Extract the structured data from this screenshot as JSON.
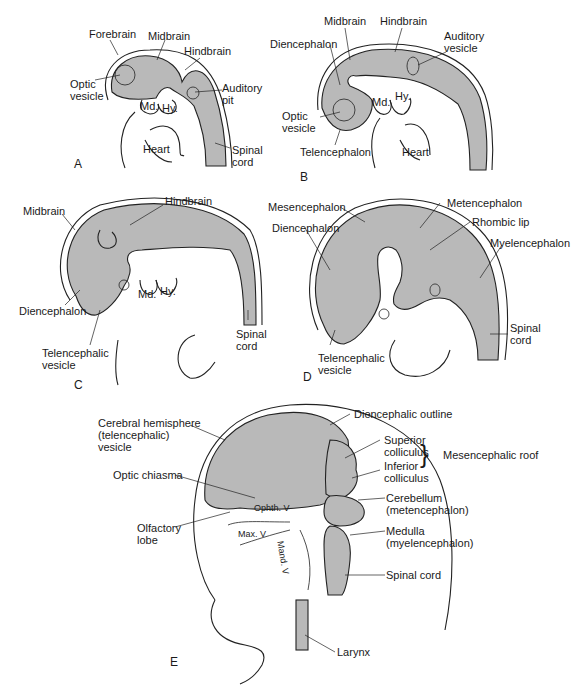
{
  "panels": {
    "A": {
      "letter": "A",
      "labels": {
        "forebrain": "Forebrain",
        "midbrain": "Midbrain",
        "hindbrain": "Hindbrain",
        "optic_vesicle": "Optic\nvesicle",
        "auditory_pit": "Auditory\npit",
        "md": "Md.",
        "hy": "Hy.",
        "heart": "Heart",
        "spinal_cord": "Spinal\ncord"
      }
    },
    "B": {
      "letter": "B",
      "labels": {
        "midbrain": "Midbrain",
        "hindbrain": "Hindbrain",
        "diencephalon": "Diencephalon",
        "auditory_vesicle": "Auditory\nvesicle",
        "optic_vesicle": "Optic\nvesicle",
        "md": "Md.",
        "hy": "Hy.",
        "telencephalon": "Telencephalon",
        "heart": "Heart"
      }
    },
    "C": {
      "letter": "C",
      "labels": {
        "hindbrain": "Hindbrain",
        "midbrain": "Midbrain",
        "md": "Md.",
        "hy": "Hy.",
        "diencephalon": "Diencephalon",
        "spinal_cord": "Spinal\ncord",
        "telencephalic_vesicle": "Telencephalic\nvesicle"
      }
    },
    "D": {
      "letter": "D",
      "labels": {
        "mesencephalon": "Mesencephalon",
        "metencephalon": "Metencephalon",
        "rhombic_lip": "Rhombic lip",
        "diencephalon": "Diencephalon",
        "myelencephalon": "Myelencephalon",
        "spinal_cord": "Spinal\ncord",
        "telencephalic_vesicle": "Telencephalic\nvesicle"
      }
    },
    "E": {
      "letter": "E",
      "labels": {
        "cerebral_hemisphere": "Cerebral hemisphere\n(telencephalic)\nvesicle",
        "diencephalic_outline": "Diencephalic outline",
        "superior_colliculus": "Superior\ncolliculus",
        "inferior_colliculus": "Inferior\ncolliculus",
        "mesencephalic_roof": "Mesencephalic roof",
        "optic_chiasma": "Optic chiasma",
        "cerebellum": "Cerebellum\n(metencephalon)",
        "ophth_v": "Ophth. V",
        "olfactory_lobe": "Olfactory\nlobe",
        "max_v": "Max. V",
        "mand_v": "Mand. V",
        "medulla": "Medulla\n(myelencephalon)",
        "spinal_cord": "Spinal cord",
        "larynx": "Larynx"
      }
    }
  },
  "colors": {
    "brain_fill": "#b9b9b9",
    "outline": "#222222",
    "background": "#ffffff"
  }
}
